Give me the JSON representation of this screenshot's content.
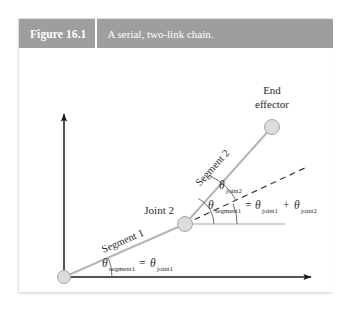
{
  "figure": {
    "number_label": "Figure 16.1",
    "caption": "A serial, two-link chain.",
    "header_bg": "#9e9e9e",
    "header_text_color": "#ffffff"
  },
  "diagram": {
    "type": "kinematic-chain-schematic",
    "colors": {
      "axis": "#1a1a1a",
      "link": "#b0b0b0",
      "joint_fill": "#d8d8d8",
      "joint_stroke": "#9a9a9a",
      "dashed": "#3a3a3a",
      "arc": "#6e6e6e",
      "text": "#2b2b2b"
    },
    "labels": {
      "joint1": "Joint 1",
      "joint2": "Joint 2",
      "end_effector_line1": "End",
      "end_effector_line2": "effector",
      "segment1": "Segment 1",
      "segment2": "Segment 2",
      "theta_symbol": "θ",
      "theta_joint2_sub": "joint2",
      "eq_lower_lhs_sub": "segment1",
      "eq_lower_eq": "=",
      "eq_lower_rhs_sub": "joint1",
      "eq_upper_lhs_sub": "segment1",
      "eq_upper_eq": "=",
      "eq_upper_rhs1_sub": "joint1",
      "eq_upper_plus": "+",
      "eq_upper_rhs2_sub": "joint2"
    },
    "geometry": {
      "joint1": [
        45,
        229
      ],
      "joint2": [
        166,
        176
      ],
      "end_effector": [
        253,
        79
      ],
      "y_axis_top": [
        45,
        63
      ],
      "x_axis_right": [
        296,
        229
      ],
      "dashed_end": [
        288,
        119
      ],
      "joint2_horizontal_end": [
        266,
        176
      ]
    }
  }
}
